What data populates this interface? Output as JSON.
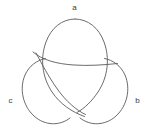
{
  "figure": {
    "kind": "trefoil-knot-diagram",
    "canvas": {
      "width": 153,
      "height": 129,
      "background": "#ffffff"
    },
    "stroke": {
      "color": "#5a5a5a",
      "width": 0.9
    },
    "center": {
      "x": 76,
      "y": 72
    },
    "labels": [
      {
        "id": "a",
        "text": "a",
        "position": "top",
        "x": 74,
        "y": 8
      },
      {
        "id": "b",
        "text": "b",
        "position": "bottom-right",
        "x": 137,
        "y": 101
      },
      {
        "id": "c",
        "text": "c",
        "position": "bottom-left",
        "x": 10,
        "y": 101
      }
    ],
    "lobes": [
      {
        "id": "a",
        "label": "a",
        "rotation_deg": -90,
        "radius_x": 30,
        "radius_y": 44,
        "description": "tall lobe pointing up, labelled a"
      },
      {
        "id": "b",
        "label": "b",
        "rotation_deg": 30,
        "radius_x": 30,
        "radius_y": 44,
        "description": "lobe pointing down-right, labelled b"
      },
      {
        "id": "c",
        "label": "c",
        "rotation_deg": 150,
        "radius_x": 30,
        "radius_y": 44,
        "description": "lobe pointing down-left, labelled c"
      }
    ],
    "crossings": [
      {
        "id": "upper-left",
        "x": 50,
        "y": 62,
        "over": "a",
        "under": "c"
      },
      {
        "id": "upper-right",
        "x": 108,
        "y": 62,
        "over": "c",
        "under": "b"
      },
      {
        "id": "bottom",
        "x": 79,
        "y": 113,
        "over": "b",
        "under": "a"
      }
    ]
  }
}
